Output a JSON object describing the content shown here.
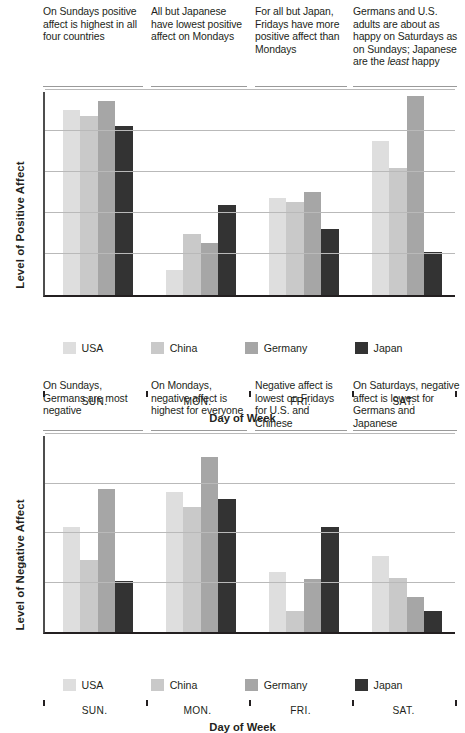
{
  "figures": [
    {
      "id": "positive-affect",
      "ylabel": "Level of Positive Affect",
      "xlabel": "Day of Week",
      "annotations": [
        "On Sundays positive affect is highest in all four countries",
        "All but Japanese have lowest positive affect on Mondays",
        "For all but Japan, Fridays have more positive affect than Mondays",
        "Germans and U.S. adults are about as happy on Saturdays as on Sundays; Japanese are the least happy"
      ],
      "chart_data": {
        "type": "bar",
        "title": "Level of Positive Affect by Day of Week",
        "xlabel": "Day of Week",
        "ylabel": "Level of Positive Affect",
        "categories": [
          "SUN.",
          "MON.",
          "FRI.",
          "SAT."
        ],
        "series": [
          {
            "name": "USA",
            "color": "#dedede",
            "values": [
              4.52,
              0.62,
              2.36,
              3.76
            ]
          },
          {
            "name": "China",
            "color": "#c9c9c9",
            "values": [
              4.36,
              1.5,
              2.26,
              3.1
            ]
          },
          {
            "name": "Germany",
            "color": "#a6a6a6",
            "values": [
              4.72,
              1.26,
              2.52,
              4.86
            ]
          },
          {
            "name": "Japan",
            "color": "#333333",
            "values": [
              4.12,
              2.2,
              1.62,
              1.06
            ]
          }
        ],
        "ylim": [
          0,
          5.0
        ],
        "gridlines": [
          1.0,
          2.0,
          3.0,
          4.0,
          5.0
        ],
        "grid": true,
        "legend_position": "bottom",
        "axis_tick_labels_y": false
      },
      "legend": [
        {
          "label": "USA",
          "color": "#dedede"
        },
        {
          "label": "China",
          "color": "#c9c9c9"
        },
        {
          "label": "Germany",
          "color": "#a6a6a6"
        },
        {
          "label": "Japan",
          "color": "#333333"
        }
      ]
    },
    {
      "id": "negative-affect",
      "ylabel": "Level of Negative Affect",
      "xlabel": "Day of Week",
      "annotations": [
        "On Sundays, Germans are most negative",
        "On Mondays, negative affect is highest for everyone",
        "Negative affect is lowest on Fridays for U.S. and Chinese",
        "On Saturdays, negative affect is lowest for Germans and Japanese"
      ],
      "chart_data": {
        "type": "bar",
        "title": "Level of Negative Affect by Day of Week",
        "xlabel": "Day of Week",
        "ylabel": "Level of Negative Affect",
        "categories": [
          "SUN.",
          "MON.",
          "FRI.",
          "SAT."
        ],
        "series": [
          {
            "name": "USA",
            "color": "#dedede",
            "values": [
              2.12,
              2.82,
              1.22,
              1.54
            ]
          },
          {
            "name": "China",
            "color": "#c9c9c9",
            "values": [
              1.46,
              2.52,
              0.42,
              1.1
            ]
          },
          {
            "name": "Germany",
            "color": "#a6a6a6",
            "values": [
              2.88,
              3.54,
              1.08,
              0.7
            ]
          },
          {
            "name": "Japan",
            "color": "#333333",
            "values": [
              1.04,
              2.68,
              2.12,
              0.42
            ]
          }
        ],
        "ylim": [
          0,
          4.0
        ],
        "gridlines": [
          1.0,
          2.0,
          3.0,
          4.0
        ],
        "grid": true,
        "legend_position": "bottom",
        "axis_tick_labels_y": false
      },
      "legend": [
        {
          "label": "USA",
          "color": "#dedede"
        },
        {
          "label": "China",
          "color": "#c9c9c9"
        },
        {
          "label": "Germany",
          "color": "#a6a6a6"
        },
        {
          "label": "Japan",
          "color": "#333333"
        }
      ]
    }
  ]
}
